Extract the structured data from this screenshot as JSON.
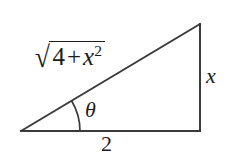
{
  "figure": {
    "name": "right-triangle-trig-diagram",
    "background_color": "#ffffff",
    "stroke_color": "#3a3a3a",
    "text_color": "#1c1c1c",
    "stroke_width": 2,
    "geometry": {
      "vertices": {
        "bottom_left": [
          21,
          131
        ],
        "bottom_right": [
          200,
          131
        ],
        "top_right": [
          200,
          24
        ]
      },
      "angle_arc": {
        "center": [
          21,
          131
        ],
        "radius": 59,
        "start_deg": 0,
        "end_deg": 31
      }
    },
    "labels": {
      "hypotenuse": {
        "radical_sign": "√",
        "radicand_first": "4",
        "operator": "+",
        "radicand_var": "x",
        "radicand_exponent": "2",
        "plain_text": "√(4 + x²)"
      },
      "angle": "θ",
      "vertical_leg": "x",
      "base": "2"
    }
  }
}
